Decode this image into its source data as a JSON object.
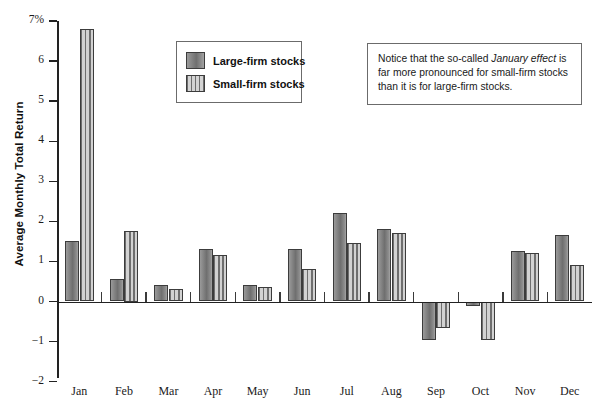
{
  "chart_data": {
    "type": "bar",
    "title": "",
    "xlabel": "",
    "ylabel": "Average Monthly Total Return",
    "categories": [
      "Jan",
      "Feb",
      "Mar",
      "Apr",
      "May",
      "Jun",
      "Jul",
      "Aug",
      "Sep",
      "Oct",
      "Nov",
      "Dec"
    ],
    "series": [
      {
        "name": "Large-firm stocks",
        "values": [
          1.52,
          0.55,
          0.4,
          1.3,
          0.4,
          1.3,
          2.2,
          1.8,
          -0.95,
          -0.1,
          1.25,
          1.67
        ],
        "color": "#7d7d7d",
        "fill": "solid"
      },
      {
        "name": "Small-firm stocks",
        "values": [
          6.8,
          1.75,
          0.32,
          1.15,
          0.37,
          0.82,
          1.45,
          1.72,
          -0.65,
          -0.95,
          1.2,
          0.9
        ],
        "color": "#c0c0c0",
        "fill": "vertical-stripes"
      }
    ],
    "ylim": [
      -2,
      7
    ],
    "ytick_values": [
      7,
      6,
      5,
      4,
      3,
      2,
      1,
      0,
      -1,
      -2
    ],
    "ytick_labels": [
      "7%",
      "6",
      "5",
      "4",
      "3",
      "2",
      "1",
      "0",
      "−1",
      "−2"
    ],
    "grid": false,
    "legend_position": "upper-left-inside"
  },
  "legend": {
    "items": [
      {
        "label": "Large-firm stocks",
        "fill": "solid"
      },
      {
        "label": "Small-firm stocks",
        "fill": "vertical-stripes"
      }
    ]
  },
  "note": {
    "line1_pre": "Notice that the so-called ",
    "line1_ital": "January effect",
    "rest": " is far more pronounced for small-firm stocks than it is for large-firm stocks."
  }
}
